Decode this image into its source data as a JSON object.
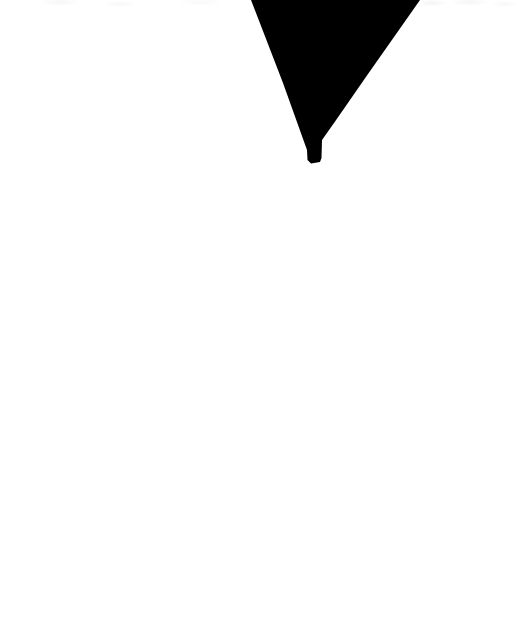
{
  "page": {
    "name": "scanned-page-fragment",
    "width": 517,
    "height": 638,
    "background_color": "#ffffff",
    "ink_color": "#000000",
    "noise_color": "#fafafa",
    "text_content": ""
  },
  "glyph": {
    "name": "v-wedge-glyph",
    "shape": "downward-pointing-wedge",
    "fill": "#000000",
    "cropped_at": "top",
    "bounds": {
      "x": 251,
      "y": 0,
      "width": 169,
      "height": 163
    },
    "vertices": {
      "top_left": [
        251,
        0
      ],
      "top_right": [
        420,
        0
      ],
      "right_inner": [
        322,
        140
      ],
      "stem_right": [
        321,
        161
      ],
      "bottom_tip": [
        309,
        163
      ]
    },
    "path": "M 251 0 L 420 0 L 368 74 L 334 123 L 322 140 L 321.5 158 L 320 162 L 311 163.5 L 307.5 160 L 307 150 L 283 83 Z"
  },
  "content": {
    "body_text": "",
    "has_visible_text": false
  }
}
